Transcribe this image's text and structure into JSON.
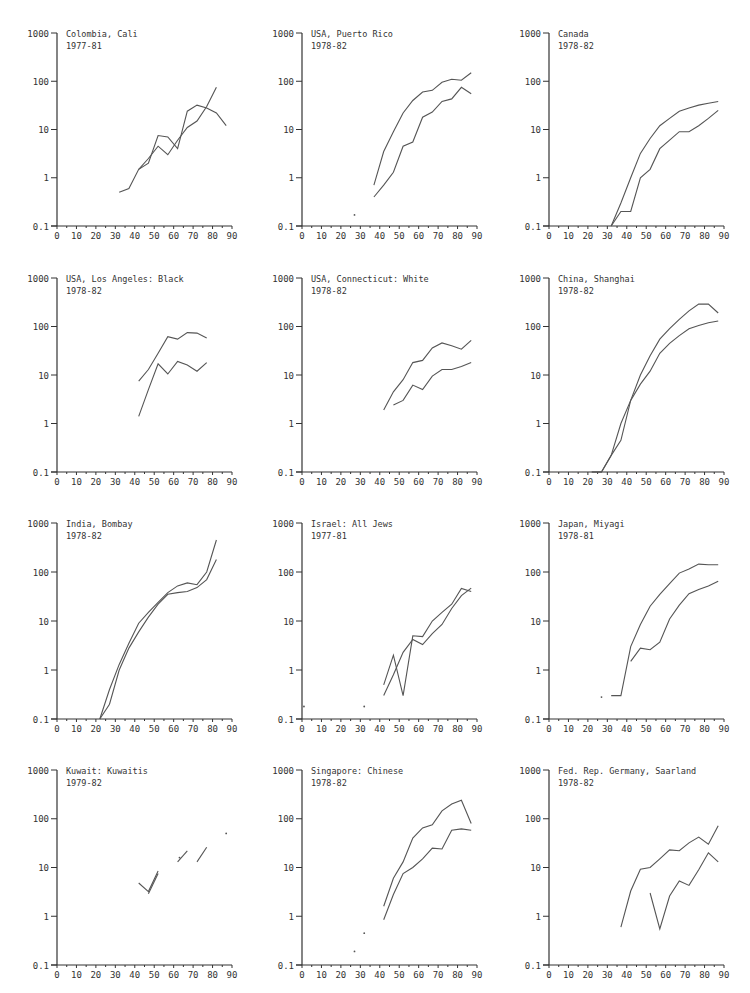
{
  "chart_data": [
    {
      "type": "line",
      "title": "Colombia, Cali",
      "subtitle": "1977-81",
      "yscale": "log",
      "ylim": [
        0.1,
        1000
      ],
      "xlim": [
        0,
        90
      ],
      "yticks": [
        "1000",
        "100",
        "10",
        "1",
        "0.1"
      ],
      "xticks": [
        "0",
        "10",
        "20",
        "30",
        "40",
        "50",
        "60",
        "70",
        "80",
        "90"
      ],
      "series": [
        {
          "name": "upper",
          "x": [
            32,
            37,
            42,
            47,
            52,
            57,
            62,
            67,
            72,
            77,
            82,
            87
          ],
          "y": [
            0.5,
            0.6,
            1.5,
            2.0,
            7.5,
            7.0,
            4.0,
            24,
            32,
            28,
            22,
            12
          ]
        },
        {
          "name": "lower",
          "x": [
            42,
            47,
            52,
            57,
            62,
            67,
            72,
            77,
            82
          ],
          "y": [
            1.5,
            2.5,
            4.5,
            3.0,
            6.0,
            11,
            15,
            30,
            75
          ]
        }
      ]
    },
    {
      "type": "line",
      "title": "USA, Puerto Rico",
      "subtitle": "1978-82",
      "yscale": "log",
      "ylim": [
        0.1,
        1000
      ],
      "xlim": [
        0,
        90
      ],
      "yticks": [
        "1000",
        "100",
        "10",
        "1",
        "0.1"
      ],
      "xticks": [
        "0",
        "10",
        "20",
        "30",
        "40",
        "50",
        "60",
        "70",
        "80",
        "90"
      ],
      "points": [
        {
          "x": 27,
          "y": 0.17
        }
      ],
      "series": [
        {
          "name": "upper",
          "x": [
            37,
            42,
            47,
            52,
            57,
            62,
            67,
            72,
            77,
            82,
            87
          ],
          "y": [
            0.7,
            3.5,
            9,
            22,
            40,
            60,
            65,
            95,
            110,
            105,
            150
          ]
        },
        {
          "name": "lower",
          "x": [
            37,
            42,
            47,
            52,
            57,
            62,
            67,
            72,
            77,
            82,
            87
          ],
          "y": [
            0.4,
            0.7,
            1.3,
            4.5,
            5.5,
            18,
            23,
            38,
            43,
            75,
            55
          ]
        }
      ]
    },
    {
      "type": "line",
      "title": "Canada",
      "subtitle": "1978-82",
      "yscale": "log",
      "ylim": [
        0.1,
        1000
      ],
      "xlim": [
        0,
        90
      ],
      "yticks": [
        "1000",
        "100",
        "10",
        "1",
        "0.1"
      ],
      "xticks": [
        "0",
        "10",
        "20",
        "30",
        "40",
        "50",
        "60",
        "70",
        "80",
        "90"
      ],
      "series": [
        {
          "name": "upper",
          "x": [
            32,
            37,
            42,
            47,
            52,
            57,
            62,
            67,
            72,
            77,
            82,
            87
          ],
          "y": [
            0.1,
            0.3,
            1.0,
            3.2,
            6.5,
            12,
            17,
            24,
            28,
            32,
            35,
            38
          ]
        },
        {
          "name": "lower",
          "x": [
            32,
            37,
            42,
            47,
            52,
            57,
            62,
            67,
            72,
            77,
            82,
            87
          ],
          "y": [
            0.1,
            0.2,
            0.2,
            1.0,
            1.5,
            4.0,
            6.0,
            9.0,
            9.0,
            12,
            17,
            25
          ]
        }
      ]
    },
    {
      "type": "line",
      "title": "USA, Los Angeles: Black",
      "subtitle": "1978-82",
      "yscale": "log",
      "ylim": [
        0.1,
        1000
      ],
      "xlim": [
        0,
        90
      ],
      "yticks": [
        "1000",
        "100",
        "10",
        "1",
        "0.1"
      ],
      "xticks": [
        "0",
        "10",
        "20",
        "30",
        "40",
        "50",
        "60",
        "70",
        "80",
        "90"
      ],
      "series": [
        {
          "name": "upper",
          "x": [
            42,
            47,
            52,
            57,
            62,
            67,
            72,
            77
          ],
          "y": [
            7.5,
            13,
            28,
            62,
            55,
            75,
            73,
            58
          ]
        },
        {
          "name": "lower",
          "x": [
            42,
            47,
            52,
            57,
            62,
            67,
            72,
            77
          ],
          "y": [
            1.4,
            5,
            17,
            10.5,
            19,
            16,
            12,
            18
          ]
        }
      ]
    },
    {
      "type": "line",
      "title": "USA, Connecticut: White",
      "subtitle": "1978-82",
      "yscale": "log",
      "ylim": [
        0.1,
        1000
      ],
      "xlim": [
        0,
        90
      ],
      "yticks": [
        "1000",
        "100",
        "10",
        "1",
        "0.1"
      ],
      "xticks": [
        "0",
        "10",
        "20",
        "30",
        "40",
        "50",
        "60",
        "70",
        "80",
        "90"
      ],
      "series": [
        {
          "name": "upper",
          "x": [
            42,
            47,
            52,
            57,
            62,
            67,
            72,
            77,
            82,
            87
          ],
          "y": [
            1.9,
            4.5,
            8,
            18,
            20,
            36,
            46,
            40,
            34,
            52
          ]
        },
        {
          "name": "lower",
          "x": [
            47,
            52,
            57,
            62,
            67,
            72,
            77,
            82,
            87
          ],
          "y": [
            2.4,
            3.0,
            6.2,
            5.0,
            9.5,
            13,
            13,
            15,
            18
          ]
        }
      ]
    },
    {
      "type": "line",
      "title": "China, Shanghai",
      "subtitle": "1978-82",
      "yscale": "log",
      "ylim": [
        0.1,
        1000
      ],
      "xlim": [
        0,
        90
      ],
      "yticks": [
        "1000",
        "100",
        "10",
        "1",
        "0.1"
      ],
      "xticks": [
        "0",
        "10",
        "20",
        "30",
        "40",
        "50",
        "60",
        "70",
        "80",
        "90"
      ],
      "series": [
        {
          "name": "upper",
          "x": [
            22,
            27,
            32,
            37,
            42,
            47,
            52,
            57,
            62,
            67,
            72,
            77,
            82,
            87
          ],
          "y": [
            0.1,
            0.1,
            0.22,
            1.0,
            3.0,
            10,
            25,
            55,
            90,
            140,
            210,
            290,
            290,
            190
          ]
        },
        {
          "name": "lower",
          "x": [
            22,
            27,
            32,
            37,
            42,
            47,
            52,
            57,
            62,
            67,
            72,
            77,
            82,
            87
          ],
          "y": [
            0.1,
            0.1,
            0.22,
            0.45,
            3.0,
            6.5,
            12,
            28,
            45,
            65,
            90,
            105,
            120,
            130
          ]
        }
      ]
    },
    {
      "type": "line",
      "title": "India, Bombay",
      "subtitle": "1978-82",
      "yscale": "log",
      "ylim": [
        0.1,
        1000
      ],
      "xlim": [
        0,
        90
      ],
      "yticks": [
        "1000",
        "100",
        "10",
        "1",
        "0.1"
      ],
      "xticks": [
        "0",
        "10",
        "20",
        "30",
        "40",
        "50",
        "60",
        "70",
        "80",
        "90"
      ],
      "series": [
        {
          "name": "upper",
          "x": [
            22,
            27,
            32,
            37,
            42,
            47,
            52,
            57,
            62,
            67,
            72,
            77,
            82
          ],
          "y": [
            0.1,
            0.4,
            1.3,
            3.5,
            9,
            15,
            24,
            38,
            52,
            60,
            55,
            100,
            450
          ]
        },
        {
          "name": "lower",
          "x": [
            22,
            27,
            32,
            37,
            42,
            47,
            52,
            57,
            62,
            67,
            72,
            77,
            82
          ],
          "y": [
            0.1,
            0.2,
            1.0,
            2.8,
            6,
            12,
            22,
            35,
            38,
            40,
            48,
            70,
            180
          ]
        }
      ]
    },
    {
      "type": "line",
      "title": "Israel: All Jews",
      "subtitle": "1977-81",
      "yscale": "log",
      "ylim": [
        0.1,
        1000
      ],
      "xlim": [
        0,
        90
      ],
      "yticks": [
        "1000",
        "100",
        "10",
        "1",
        "0.1"
      ],
      "xticks": [
        "0",
        "10",
        "20",
        "30",
        "40",
        "50",
        "60",
        "70",
        "80",
        "90"
      ],
      "points": [
        {
          "x": 1,
          "y": 0.18
        },
        {
          "x": 32,
          "y": 0.18
        }
      ],
      "series": [
        {
          "name": "upper",
          "x": [
            42,
            47,
            52,
            57,
            62,
            67,
            72,
            77,
            82,
            87
          ],
          "y": [
            0.5,
            2.0,
            0.3,
            5.0,
            4.8,
            10,
            15,
            22,
            46,
            40
          ]
        },
        {
          "name": "lower",
          "x": [
            42,
            47,
            52,
            57,
            62,
            67,
            72,
            77,
            82,
            87
          ],
          "y": [
            0.3,
            0.8,
            2.3,
            4.2,
            3.3,
            5.5,
            8.5,
            18,
            33,
            47
          ]
        }
      ]
    },
    {
      "type": "line",
      "title": "Japan, Miyagi",
      "subtitle": "1978-81",
      "yscale": "log",
      "ylim": [
        0.1,
        1000
      ],
      "xlim": [
        0,
        90
      ],
      "yticks": [
        "1000",
        "100",
        "10",
        "1",
        "0.1"
      ],
      "xticks": [
        "0",
        "10",
        "20",
        "30",
        "40",
        "50",
        "60",
        "70",
        "80",
        "90"
      ],
      "points": [
        {
          "x": 27,
          "y": 0.28
        }
      ],
      "series": [
        {
          "name": "upper",
          "x": [
            32,
            37,
            42,
            47,
            52,
            57,
            62,
            67,
            72,
            77,
            82,
            87
          ],
          "y": [
            0.3,
            0.3,
            3.0,
            8.5,
            20,
            35,
            58,
            95,
            115,
            145,
            140,
            140
          ]
        },
        {
          "name": "lower",
          "x": [
            42,
            47,
            52,
            57,
            62,
            67,
            72,
            77,
            82,
            87
          ],
          "y": [
            1.5,
            2.8,
            2.6,
            3.7,
            11,
            21,
            36,
            44,
            52,
            65
          ]
        }
      ]
    },
    {
      "type": "line",
      "title": "Kuwait: Kuwaitis",
      "subtitle": "1979-82",
      "yscale": "log",
      "ylim": [
        0.1,
        1000
      ],
      "xlim": [
        0,
        90
      ],
      "yticks": [
        "1000",
        "100",
        "10",
        "1",
        "0.1"
      ],
      "xticks": [
        "0",
        "10",
        "20",
        "30",
        "40",
        "50",
        "60",
        "70",
        "80",
        "90"
      ],
      "points": [
        {
          "x": 87,
          "y": 50
        },
        {
          "x": 63,
          "y": 16
        }
      ],
      "series": [
        {
          "name": "upper",
          "segments": [
            {
              "x": [
                42,
                47,
                52
              ],
              "y": [
                4.8,
                3.2,
                8.5
              ]
            },
            {
              "x": [
                62,
                67
              ],
              "y": [
                13,
                22
              ]
            },
            {
              "x": [
                72,
                77
              ],
              "y": [
                13,
                26
              ]
            }
          ]
        },
        {
          "name": "lower",
          "segments": [
            {
              "x": [
                47,
                52
              ],
              "y": [
                2.9,
                7.5
              ]
            }
          ]
        }
      ]
    },
    {
      "type": "line",
      "title": "Singapore: Chinese",
      "subtitle": "1978-82",
      "yscale": "log",
      "ylim": [
        0.1,
        1000
      ],
      "xlim": [
        0,
        90
      ],
      "yticks": [
        "1000",
        "100",
        "10",
        "1",
        "0.1"
      ],
      "xticks": [
        "0",
        "10",
        "20",
        "30",
        "40",
        "50",
        "60",
        "70",
        "80",
        "90"
      ],
      "points": [
        {
          "x": 27,
          "y": 0.19
        },
        {
          "x": 32,
          "y": 0.45
        }
      ],
      "series": [
        {
          "name": "upper",
          "x": [
            42,
            47,
            52,
            57,
            62,
            67,
            72,
            77,
            82,
            87
          ],
          "y": [
            1.6,
            6,
            13,
            40,
            65,
            75,
            145,
            200,
            240,
            80
          ]
        },
        {
          "name": "lower",
          "x": [
            42,
            47,
            52,
            57,
            62,
            67,
            72,
            77,
            82,
            87
          ],
          "y": [
            0.85,
            2.8,
            7.5,
            10,
            15,
            25,
            24,
            58,
            62,
            58
          ]
        }
      ]
    },
    {
      "type": "line",
      "title": "Fed. Rep. Germany, Saarland",
      "subtitle": "1978-82",
      "yscale": "log",
      "ylim": [
        0.1,
        1000
      ],
      "xlim": [
        0,
        90
      ],
      "yticks": [
        "1000",
        "100",
        "10",
        "1",
        "0.1"
      ],
      "xticks": [
        "0",
        "10",
        "20",
        "30",
        "40",
        "50",
        "60",
        "70",
        "80",
        "90"
      ],
      "series": [
        {
          "name": "upper",
          "x": [
            37,
            42,
            47,
            52,
            57,
            62,
            67,
            72,
            77,
            82,
            87
          ],
          "y": [
            0.6,
            3.3,
            9.2,
            10,
            15,
            23,
            22,
            32,
            42,
            30,
            72
          ]
        },
        {
          "name": "lower",
          "x": [
            52,
            57,
            62,
            67,
            72,
            77,
            82,
            87
          ],
          "y": [
            3,
            0.55,
            2.6,
            5.3,
            4.3,
            9,
            20,
            13
          ]
        }
      ]
    }
  ],
  "layout": {
    "line_color": "#555555",
    "axis_color": "#333333"
  }
}
